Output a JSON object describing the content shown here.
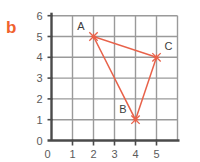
{
  "panel": {
    "label": "b"
  },
  "colors": {
    "panel_label": "#f0622e",
    "series": "#e8624a",
    "marker": "#e8624a",
    "axis": "#4a4a4a",
    "grid": "#9a9a9a",
    "tick_label": "#5b5b5b",
    "point_label": "#3d3d3d",
    "background": "#ffffff"
  },
  "chart_data": {
    "type": "scatter",
    "title": "",
    "subtitle": "",
    "xlabel": "",
    "ylabel": "",
    "xlim": [
      0,
      6
    ],
    "ylim": [
      0,
      6
    ],
    "xticks": [
      0,
      1,
      2,
      3,
      4,
      5
    ],
    "yticks": [
      0,
      1,
      2,
      3,
      4,
      5,
      6
    ],
    "xtick_labels": [
      "0",
      "1",
      "2",
      "3",
      "4",
      "5"
    ],
    "ytick_labels": [
      "0",
      "1",
      "2",
      "3",
      "4",
      "5",
      "6"
    ],
    "grid": true,
    "grid_step": 1,
    "legend": false,
    "legend_position": "none",
    "marker_style": "x-cross",
    "annotations": [
      {
        "text": "A",
        "x": 2,
        "y": 5,
        "anchor": "above-left"
      },
      {
        "text": "B",
        "x": 4,
        "y": 1,
        "anchor": "above-left"
      },
      {
        "text": "C",
        "x": 5,
        "y": 4,
        "anchor": "above-right"
      }
    ],
    "points": [
      {
        "name": "A",
        "x": 2,
        "y": 5
      },
      {
        "name": "B",
        "x": 4,
        "y": 1
      },
      {
        "name": "C",
        "x": 5,
        "y": 4
      }
    ],
    "series": [
      {
        "name": "triangle ABC",
        "type": "closed-polygon",
        "x": [
          2,
          4,
          5
        ],
        "y": [
          5,
          1,
          4
        ],
        "closed": true
      }
    ],
    "edges": [
      {
        "from": "A",
        "to": "B"
      },
      {
        "from": "B",
        "to": "C"
      },
      {
        "from": "C",
        "to": "A"
      }
    ]
  }
}
